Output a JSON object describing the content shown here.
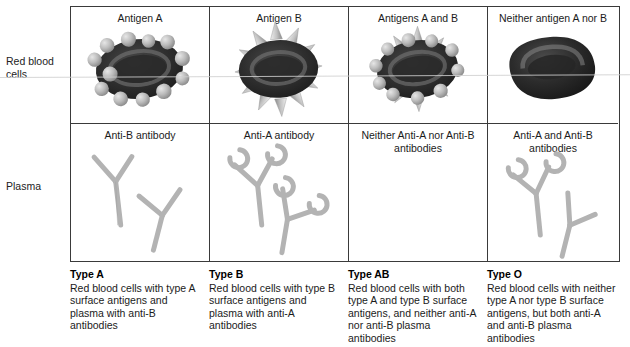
{
  "row_labels": {
    "red_blood_cells": "Red blood\ncells",
    "plasma": "Plasma"
  },
  "columns": [
    {
      "key": "type_a",
      "rbc_title": "Antigen A",
      "plasma_title": "Anti-B antibody",
      "rbc_markers": {
        "spheres": true,
        "spikes": false
      },
      "antibody_tips": "plain",
      "caption_title": "Type A",
      "caption_body": "Red blood cells with type A surface antigens and plasma with anti-B antibodies"
    },
    {
      "key": "type_b",
      "rbc_title": "Antigen B",
      "plasma_title": "Anti-A antibody",
      "rbc_markers": {
        "spheres": false,
        "spikes": true
      },
      "antibody_tips": "crescent",
      "caption_title": "Type B",
      "caption_body": "Red blood cells with type B surface antigens and plasma with anti-A antibodies"
    },
    {
      "key": "type_ab",
      "rbc_title": "Antigens A and B",
      "plasma_title": "Neither Anti-A nor Anti-B antibodies",
      "rbc_markers": {
        "spheres": true,
        "spikes": true
      },
      "antibody_tips": "none",
      "caption_title": "Type AB",
      "caption_body": "Red blood cells with both type A and type B surface antigens, and neither anti-A nor anti-B plasma antibodies"
    },
    {
      "key": "type_o",
      "rbc_title": "Neither antigen A nor B",
      "plasma_title": "Anti-A and Anti-B antibodies",
      "rbc_markers": {
        "spheres": false,
        "spikes": false
      },
      "antibody_tips": "mixed",
      "caption_title": "Type O",
      "caption_body": "Red blood cells with neither type A nor type B surface antigens, but both anti-A and anti-B plasma antibodies"
    }
  ],
  "colors": {
    "grid_border": "#3a3a3a",
    "cell_body_dark": "#262626",
    "cell_body_mid": "#3b3b3b",
    "cell_rim_light": "#8d8d8d",
    "antigen_gray": "#b9b9b9",
    "antibody_gray": "#b3b3b3",
    "background": "#ffffff",
    "text": "#1b1b1b"
  }
}
